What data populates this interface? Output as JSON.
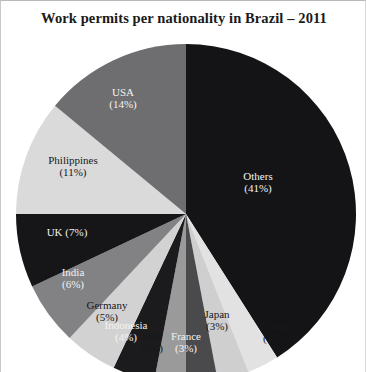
{
  "chart_title": "Work permits per nationality in Brazil – 2011",
  "chart_data": {
    "type": "pie",
    "title": "Work permits per nationality in Brazil – 2011",
    "xlabel": "",
    "ylabel": "",
    "unit": "percent",
    "total": 100,
    "legend_position": "none",
    "labels_inside_slices": true,
    "start_angle_deg": 0,
    "direction": "clockwise",
    "categories": [
      "Others",
      "China",
      "Japan",
      "France",
      "Italy",
      "Indonesia",
      "Germany",
      "India",
      "UK",
      "Philippines",
      "USA"
    ],
    "values": [
      41,
      3,
      3,
      3,
      3,
      4,
      5,
      6,
      7,
      11,
      14
    ],
    "colors": [
      "#141416",
      "#e2e2e2",
      "#cfcfcf",
      "#4a4a4c",
      "#9a9a9a",
      "#1b1b1d",
      "#d2d2d2",
      "#828284",
      "#161618",
      "#dadada",
      "#6e6e70"
    ],
    "slices": [
      {
        "name": "Others",
        "value": 41,
        "label": "Others",
        "pct_label": "(41%)",
        "color": "#141416",
        "text_color": "light",
        "layout": "stacked"
      },
      {
        "name": "China",
        "value": 3,
        "label": "China",
        "pct_label": "(3%)",
        "color": "#e2e2e2",
        "text_color": "dark",
        "layout": "stacked"
      },
      {
        "name": "Japan",
        "value": 3,
        "label": "Japan",
        "pct_label": "(3%)",
        "color": "#cfcfcf",
        "text_color": "dark",
        "layout": "stacked"
      },
      {
        "name": "France",
        "value": 3,
        "label": "France",
        "pct_label": "(3%)",
        "color": "#4a4a4c",
        "text_color": "light",
        "layout": "stacked"
      },
      {
        "name": "Italy",
        "value": 3,
        "label": "Italy",
        "pct_label": "(3%)",
        "color": "#9a9a9a",
        "text_color": "dark",
        "layout": "stacked"
      },
      {
        "name": "Indonesia",
        "value": 4,
        "label": "Indonesia",
        "pct_label": "(4%)",
        "color": "#1b1b1d",
        "text_color": "light",
        "layout": "stacked"
      },
      {
        "name": "Germany",
        "value": 5,
        "label": "Germany",
        "pct_label": "(5%)",
        "color": "#d2d2d2",
        "text_color": "dark",
        "layout": "stacked"
      },
      {
        "name": "India",
        "value": 6,
        "label": "India",
        "pct_label": "(6%)",
        "color": "#828284",
        "text_color": "light",
        "layout": "stacked"
      },
      {
        "name": "UK",
        "value": 7,
        "label": "UK",
        "pct_label": "(7%)",
        "color": "#161618",
        "text_color": "light",
        "layout": "inline"
      },
      {
        "name": "Philippines",
        "value": 11,
        "label": "Philippines",
        "pct_label": "(11%)",
        "color": "#dadada",
        "text_color": "dark",
        "layout": "stacked"
      },
      {
        "name": "USA",
        "value": 14,
        "label": "USA",
        "pct_label": "(14%)",
        "color": "#6e6e70",
        "text_color": "light",
        "layout": "stacked"
      }
    ]
  },
  "geometry": {
    "center_x": 185,
    "center_y": 213,
    "radius": 170
  },
  "label_positions": [
    {
      "x": 257,
      "y": 176
    },
    {
      "x": 273,
      "y": 326
    },
    {
      "x": 216,
      "y": 314
    },
    {
      "x": 185,
      "y": 336
    },
    {
      "x": 151,
      "y": 336
    },
    {
      "x": 125,
      "y": 325
    },
    {
      "x": 106,
      "y": 305
    },
    {
      "x": 72,
      "y": 272
    },
    {
      "x": 66,
      "y": 232
    },
    {
      "x": 72,
      "y": 160
    },
    {
      "x": 122,
      "y": 92
    }
  ]
}
